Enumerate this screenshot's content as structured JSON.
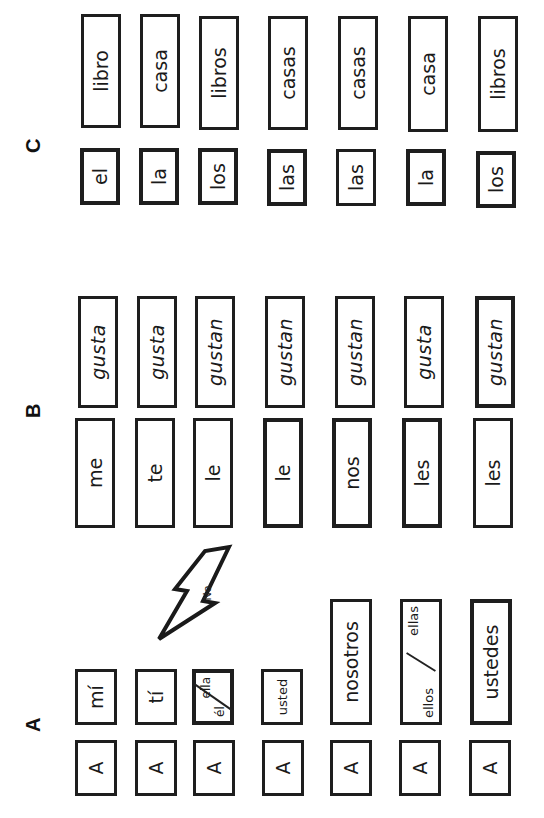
{
  "worksheet": {
    "orientation": "rotated-90-ccw",
    "sections": {
      "a": {
        "label": "A"
      },
      "b": {
        "label": "B"
      },
      "c": {
        "label": "C"
      }
    },
    "callout": {
      "text": "No",
      "shape": "lightning-bolt"
    },
    "rows": [
      {
        "prep": "A",
        "pronoun": "mí",
        "indirect_object": "me",
        "verb": "gusta",
        "article": "el",
        "noun": "libro"
      },
      {
        "prep": "A",
        "pronoun": "tí",
        "indirect_object": "te",
        "verb": "gusta",
        "article": "la",
        "noun": "casa"
      },
      {
        "prep": "A",
        "pronoun_a": "él",
        "pronoun_b": "ella",
        "indirect_object": "le",
        "verb": "gustan",
        "article": "los",
        "noun": "libros"
      },
      {
        "prep": "A",
        "pronoun": "usted",
        "indirect_object": "le",
        "verb": "gustan",
        "article": "las",
        "noun": "casas"
      },
      {
        "prep": "A",
        "pronoun": "nosotros",
        "indirect_object": "nos",
        "verb": "gustan",
        "article": "las",
        "noun": "casas"
      },
      {
        "prep": "A",
        "pronoun_a": "ellos",
        "pronoun_b": "ellas",
        "indirect_object": "les",
        "verb": "gusta",
        "article": "la",
        "noun": "casa"
      },
      {
        "prep": "A",
        "pronoun": "ustedes",
        "indirect_object": "les",
        "verb": "gustan",
        "article": "los",
        "noun": "libros"
      }
    ]
  }
}
